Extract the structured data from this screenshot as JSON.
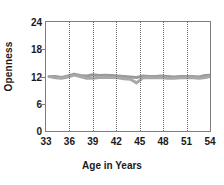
{
  "chart_data": {
    "type": "line",
    "title": "",
    "xlabel": "Age in Years",
    "ylabel": "Openness",
    "xlim": [
      33,
      54
    ],
    "ylim": [
      0,
      24
    ],
    "xticks": [
      33,
      36,
      39,
      42,
      45,
      48,
      51,
      54
    ],
    "yticks": [
      0,
      6,
      12,
      18,
      24
    ],
    "xtick_labels": [
      "33",
      "36",
      "39",
      "42",
      "45",
      "48",
      "51",
      "54"
    ],
    "ytick_labels": [
      "0",
      "6",
      "12",
      "18",
      "24"
    ],
    "grid": "vertical dotted gridlines at 36, 39, 42, 45, 48, 51",
    "legend": "none",
    "gridlines_x": [
      36,
      39,
      42,
      45,
      48,
      51
    ],
    "series": [
      {
        "name": "Openness series 1",
        "color": "#9a9a9a",
        "x": [
          33.4,
          34.2,
          35.0,
          35.8,
          36.6,
          37.4,
          38.2,
          39.0,
          39.8,
          40.6,
          41.4,
          42.2,
          43.0,
          43.8,
          44.6,
          45.4,
          46.2,
          47.0,
          47.8,
          48.6,
          49.4,
          50.2,
          51.0,
          51.8,
          52.6,
          53.4,
          54.0
        ],
        "values": [
          12.0,
          12.0,
          11.8,
          12.1,
          12.5,
          12.2,
          12.1,
          12.4,
          12.2,
          12.3,
          12.2,
          12.1,
          12.0,
          11.9,
          11.8,
          12.1,
          12.0,
          12.0,
          12.1,
          12.0,
          11.9,
          12.0,
          12.0,
          12.0,
          11.9,
          12.2,
          12.3
        ]
      },
      {
        "name": "Openness series 2",
        "color": "#a8a8a8",
        "x": [
          33.4,
          34.2,
          35.0,
          35.8,
          36.6,
          37.4,
          38.2,
          39.0,
          39.8,
          40.6,
          41.4,
          42.2,
          43.0,
          43.8,
          44.6,
          45.4,
          46.2,
          47.0,
          47.8,
          48.6,
          49.4,
          50.2,
          51.0,
          51.8,
          52.6,
          53.4,
          54.0
        ],
        "values": [
          12.0,
          11.7,
          11.6,
          11.9,
          12.3,
          12.0,
          11.6,
          11.6,
          11.8,
          11.8,
          11.8,
          11.7,
          11.5,
          11.4,
          10.6,
          11.7,
          11.8,
          11.7,
          11.7,
          11.6,
          11.6,
          11.7,
          11.8,
          11.7,
          11.6,
          11.8,
          12.0
        ]
      }
    ]
  },
  "axes": {
    "frame_color": "#7d7d7d",
    "grid_color": "#6e6e6e",
    "text_color": "#1a1a1a"
  }
}
